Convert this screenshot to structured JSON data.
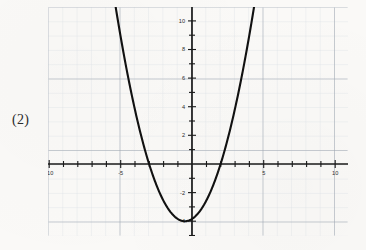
{
  "page": {
    "problem_number": "(2)",
    "background_color": "#faf9f7"
  },
  "graph": {
    "grid_minor_color": "#d8dde4",
    "grid_major_color": "#9aa3ae",
    "axis_color": "#1a1a1a",
    "curve_color": "#111111",
    "x_axis_labels": [
      "-10",
      "-5",
      "5",
      "10"
    ],
    "y_axis_labels": [
      "10",
      "8",
      "6",
      "4",
      "2",
      "-2",
      "-4"
    ]
  },
  "chart_data": {
    "type": "line",
    "title": "",
    "xlabel": "",
    "ylabel": "",
    "xlim": [
      -10.5,
      11
    ],
    "ylim": [
      -5,
      11
    ],
    "grid": true,
    "legend": null,
    "x_ticks": [
      -10,
      -5,
      0,
      5,
      10
    ],
    "x_tick_labels": [
      "-10",
      "-5",
      "",
      "5",
      "10"
    ],
    "y_ticks": [
      -4,
      -2,
      0,
      2,
      4,
      6,
      8,
      10
    ],
    "y_tick_labels": [
      "-4",
      "-2",
      "",
      "2",
      "4",
      "6",
      "8",
      "10"
    ],
    "minor_tick_step": 1,
    "major_grid_step": 5,
    "series": [
      {
        "name": "parabola",
        "equation": "y = x^2 + x - 3.75",
        "vertex": [
          -0.5,
          -4.0
        ],
        "roots": [
          -2.0,
          2.0
        ],
        "x": [
          -4.0,
          -3.75,
          -3.5,
          -3.25,
          -3.0,
          -2.75,
          -2.5,
          -2.25,
          -2.0,
          -1.75,
          -1.5,
          -1.25,
          -1.0,
          -0.75,
          -0.5,
          -0.25,
          0.0,
          0.25,
          0.5,
          0.75,
          1.0,
          1.25,
          1.5,
          1.75,
          2.0,
          2.25,
          2.5,
          2.75,
          3.0
        ],
        "y": [
          8.25,
          6.5625,
          4.9375,
          3.375,
          1.875,
          0.4375,
          -0.9375,
          -2.25,
          -3.25,
          -3.6875,
          -3.9375,
          -4.0,
          -3.75,
          -3.9375,
          -4.0,
          -3.9375,
          -3.75,
          -3.625,
          -3.0,
          -2.4375,
          -1.75,
          -1.0625,
          -0.1875,
          0.8125,
          2.25,
          3.5625,
          5.0,
          6.5625,
          8.25
        ]
      }
    ]
  }
}
